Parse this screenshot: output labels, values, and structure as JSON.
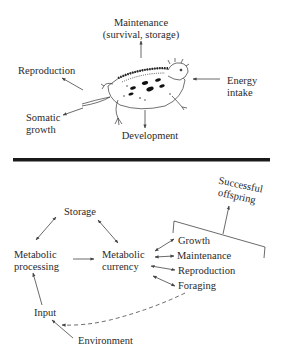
{
  "top_panel": {
    "labels": {
      "maintenance_line1": "Maintenance",
      "maintenance_line2": "(survival, storage)",
      "reproduction": "Reproduction",
      "energy_line1": "Energy",
      "energy_line2": "intake",
      "somatic_line1": "Somatic",
      "somatic_line2": "growth",
      "development": "Development"
    },
    "illustration": "horned-lizard"
  },
  "divider": {
    "color": "#1a1a1a"
  },
  "bottom_panel": {
    "labels": {
      "storage": "Storage",
      "metabolic_processing_line1": "Metabolic",
      "metabolic_processing_line2": "processing",
      "metabolic_currency_line1": "Metabolic",
      "metabolic_currency_line2": "currency",
      "growth": "Growth",
      "maintenance": "Maintenance",
      "reproduction": "Reproduction",
      "foraging": "Foraging",
      "successful_line1": "Successful",
      "successful_line2": "offspring",
      "input": "Input",
      "environment": "Environment"
    }
  },
  "colors": {
    "text": "#2a2a2a",
    "line": "#444444",
    "background": "#ffffff"
  }
}
